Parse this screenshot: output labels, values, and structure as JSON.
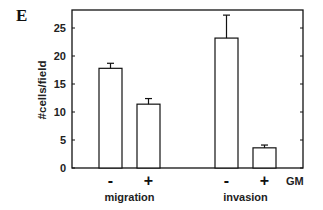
{
  "panel_label": "E",
  "chart_data": {
    "type": "bar",
    "title": "",
    "xlabel": "",
    "ylabel": "#cells/field",
    "ylim": [
      0,
      28
    ],
    "yticks": [
      0,
      5,
      10,
      15,
      20,
      25
    ],
    "grid": false,
    "legend": null,
    "groups": [
      "migration",
      "invasion"
    ],
    "treatment_label": "GM",
    "categories": [
      "migration -",
      "migration +",
      "invasion -",
      "invasion +"
    ],
    "tick_signs": [
      "-",
      "+",
      "-",
      "+"
    ],
    "values": [
      17.8,
      11.4,
      23.2,
      3.6
    ],
    "errors": [
      0.9,
      1.0,
      4.1,
      0.5
    ],
    "bar_color": "#ffffff",
    "edge_color": "#111111"
  }
}
